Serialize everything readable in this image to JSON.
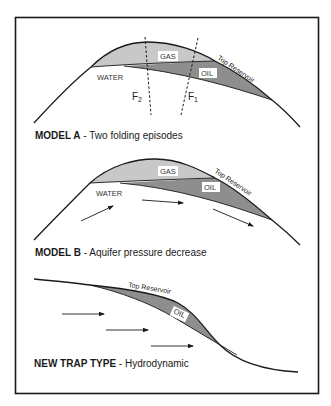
{
  "colors": {
    "gas": "#c8c8c8",
    "oil": "#8e8e8e",
    "line": "#1a1a1a",
    "frame": "#1a1a1a",
    "background": "#ffffff"
  },
  "models": [
    {
      "id": "model-a",
      "caption_bold": "MODEL A",
      "caption_rest": " - Two folding episodes",
      "labels": {
        "gas": "GAS",
        "oil": "OIL",
        "water": "WATER",
        "top_reservoir": "Top Reservoir"
      },
      "faults": [
        {
          "name": "F",
          "subscript": "2"
        },
        {
          "name": "F",
          "subscript": "1"
        }
      ]
    },
    {
      "id": "model-b",
      "caption_bold": "MODEL B",
      "caption_rest": " - Aquifer pressure decrease",
      "labels": {
        "gas": "GAS",
        "oil": "OIL",
        "water": "WATER",
        "top_reservoir": "Top Reservoir"
      },
      "flow_arrows": 3
    },
    {
      "id": "new-trap",
      "caption_bold": "NEW TRAP TYPE",
      "caption_rest": " - Hydrodynamic",
      "labels": {
        "oil": "OIL",
        "top_reservoir": "Top Reservoir"
      },
      "flow_arrows": 3
    }
  ]
}
